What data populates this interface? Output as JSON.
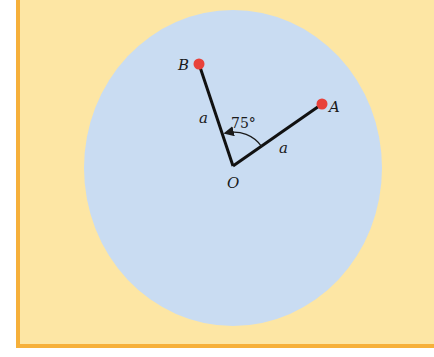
{
  "diagram": {
    "background_color": "#fde6a4",
    "border_color": "#f6b03a",
    "disc_color": "#c9dcf2",
    "point_color": "#e8413a",
    "points": [
      {
        "label": "B",
        "x": 199,
        "y": 64
      },
      {
        "label": "A",
        "x": 322,
        "y": 104
      },
      {
        "label": "O",
        "x": 233,
        "y": 166
      }
    ],
    "labels": {
      "B": "B",
      "A": "A",
      "O": "O",
      "side_ob": "a",
      "side_oa": "a",
      "angle": "75°"
    }
  }
}
